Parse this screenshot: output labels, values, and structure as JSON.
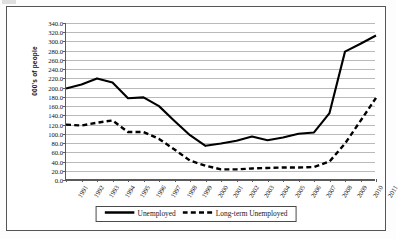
{
  "chart_data": {
    "type": "line",
    "title": "",
    "xlabel": "",
    "ylabel": "000's of people",
    "ylim": [
      0,
      340
    ],
    "ytick_step": 20,
    "grid": true,
    "legend_position": "bottom-center",
    "categories": [
      "1991",
      "1992",
      "1993",
      "1994",
      "1995",
      "1996",
      "1997",
      "1998",
      "1999",
      "2000",
      "2001",
      "2002",
      "2003",
      "2004",
      "2005",
      "2006",
      "2007",
      "2008",
      "2009",
      "2010",
      "2011"
    ],
    "ytick_labels": [
      "0.0",
      "20.0",
      "40.0",
      "60.0",
      "80.0",
      "100.0",
      "120.0",
      "140.0",
      "160.0",
      "180.0",
      "200.0",
      "220.0",
      "240.0",
      "260.0",
      "280.0",
      "300.0",
      "320.0",
      "340.0"
    ],
    "series": [
      {
        "name": "Unemployed",
        "style": "solid",
        "color": "#000000",
        "values": [
          198,
          207,
          220,
          211,
          177,
          179,
          160,
          128,
          97,
          74,
          79,
          85,
          94,
          86,
          92,
          100,
          103,
          145,
          278,
          295,
          313
        ]
      },
      {
        "name": "Long-term Unemployed",
        "style": "dashed",
        "color": "#000000",
        "values": [
          120,
          118,
          124,
          129,
          104,
          104,
          89,
          66,
          42,
          31,
          23,
          23,
          25,
          26,
          27,
          27,
          28,
          40,
          79,
          128,
          178
        ]
      }
    ]
  },
  "legend": {
    "items": [
      {
        "label": "Unemployed",
        "key": "solid-line-key"
      },
      {
        "label": "Long-term Unemployed",
        "key": "dashed-line-key"
      }
    ]
  }
}
